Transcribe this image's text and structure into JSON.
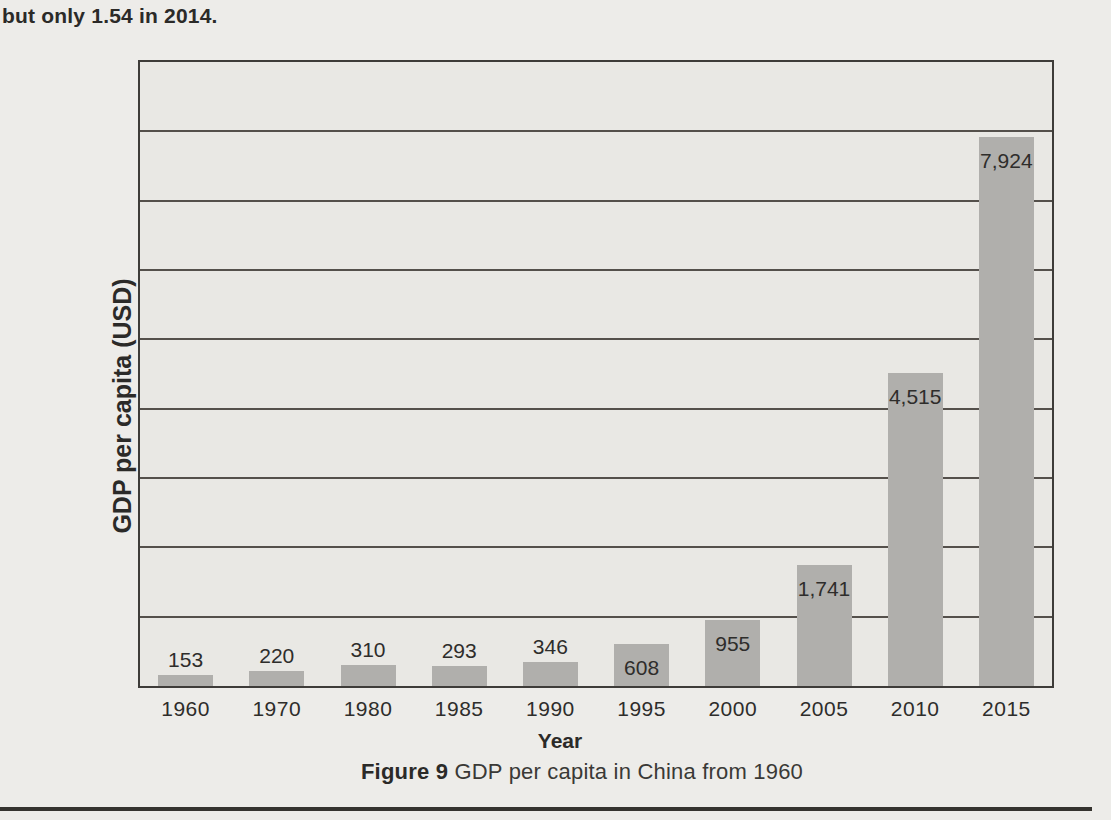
{
  "page": {
    "top_text": "but only 1.54 in 2014.",
    "caption": {
      "figure_number": "Figure 9",
      "text": " GDP per capita in China from 1960"
    }
  },
  "chart_data": {
    "type": "bar",
    "title": "Figure 9 GDP per capita in China from 1960",
    "categories": [
      "1960",
      "1970",
      "1980",
      "1985",
      "1990",
      "1995",
      "2000",
      "2005",
      "2010",
      "2015"
    ],
    "values": [
      153,
      220,
      310,
      293,
      346,
      608,
      955,
      1741,
      4515,
      7924
    ],
    "value_labels": [
      "153",
      "220",
      "310",
      "293",
      "346",
      "608",
      "955",
      "1,741",
      "4,515",
      "7,924"
    ],
    "xlabel": "Year",
    "ylabel": "GDP per capita (USD)",
    "ylim": [
      0,
      9000
    ],
    "gridline_interval": 1000,
    "grid": "horizontal gridlines, no y tick labels",
    "legend": "none",
    "colors": {
      "bar": "#b0afac",
      "plot_background": "#e9e8e4",
      "page_background": "#edece9",
      "frame_line": "#3e3c39",
      "gridline": "#54504b",
      "text": "#2e2d2b"
    }
  }
}
